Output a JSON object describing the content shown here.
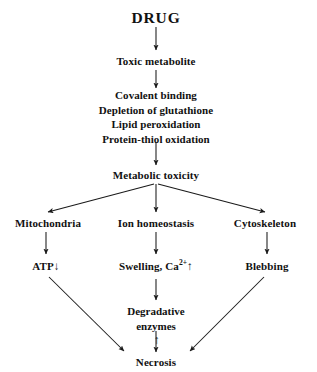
{
  "diagram": {
    "title": "DRUG",
    "type": "flowchart",
    "background_color": "#ffffff",
    "line_color": "#1a1a1a",
    "text_color": "#111111",
    "nodes": {
      "drug": "DRUG",
      "toxic_metabolite": "Toxic metabolite",
      "mechanisms": [
        "Covalent binding",
        "Depletion of glutathione",
        "Lipid peroxidation",
        "Protein-thiol oxidation"
      ],
      "metabolic_toxicity": "Metabolic toxicity",
      "mitochondria": "Mitochondria",
      "ion_homeostasis": "Ion homeostasis",
      "cytoskeleton": "Cytoskeleton",
      "atp": {
        "label": "ATP",
        "arrow": "↓"
      },
      "swelling": {
        "prefix": "Swelling, Ca",
        "superscript": "2+",
        "arrow": "↑"
      },
      "blebbing": "Blebbing",
      "degradative_enzymes": {
        "line1": "Degradative",
        "line2": "enzymes",
        "arrow": "↑"
      },
      "necrosis": "Necrosis"
    }
  }
}
